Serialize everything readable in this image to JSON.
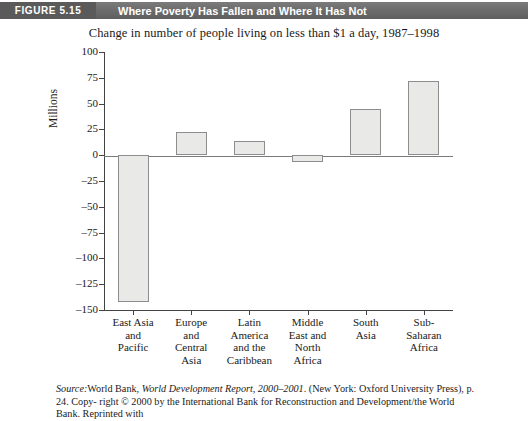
{
  "header": {
    "figure_tag": "FIGURE 5.15",
    "figure_title": "Where Poverty Has Fallen and Where It Has Not"
  },
  "source_note": {
    "line1_label": "Source:",
    "line1_rest_a": "World Bank, ",
    "line1_italic": "World Development Report, 2000–2001",
    "line1_rest_b": ". (New York: Oxford University Press), p. 24. Copy-",
    "line2": "right © 2000 by the International Bank for Reconstruction and Development/the World Bank. Reprinted with"
  },
  "chart_data": {
    "type": "bar",
    "title": "Change in number of people living on less than $1 a day, 1987–1998",
    "xlabel": "",
    "ylabel": "Millions",
    "categories": [
      "East Asia and Pacific",
      "Europe and Central Asia",
      "Latin America and the Caribbean",
      "Middle East and North Africa",
      "South Asia",
      "Sub-Saharan Africa"
    ],
    "category_lines": [
      [
        "East Asia",
        "and",
        "Pacific"
      ],
      [
        "Europe",
        "and",
        "Central",
        "Asia"
      ],
      [
        "Latin",
        "America",
        "and the",
        "Caribbean"
      ],
      [
        "Middle",
        "East and",
        "North",
        "Africa"
      ],
      [
        "South",
        "Asia"
      ],
      [
        "Sub-",
        "Saharan",
        "Africa"
      ]
    ],
    "values": [
      -142,
      22,
      14,
      -7,
      45,
      72
    ],
    "ylim": [
      -150,
      100
    ],
    "ytick_values": [
      100,
      75,
      50,
      25,
      0,
      -25,
      -50,
      -75,
      -100,
      -125,
      -150
    ],
    "ytick_labels": [
      "100",
      "75",
      "50",
      "25",
      "0",
      "–25",
      "–50",
      "–75",
      "–100",
      "–125",
      "–150"
    ],
    "grid": false,
    "legend": "none",
    "bar_fill": "#e9e9e7",
    "bar_stroke": "#8d8d8d"
  }
}
